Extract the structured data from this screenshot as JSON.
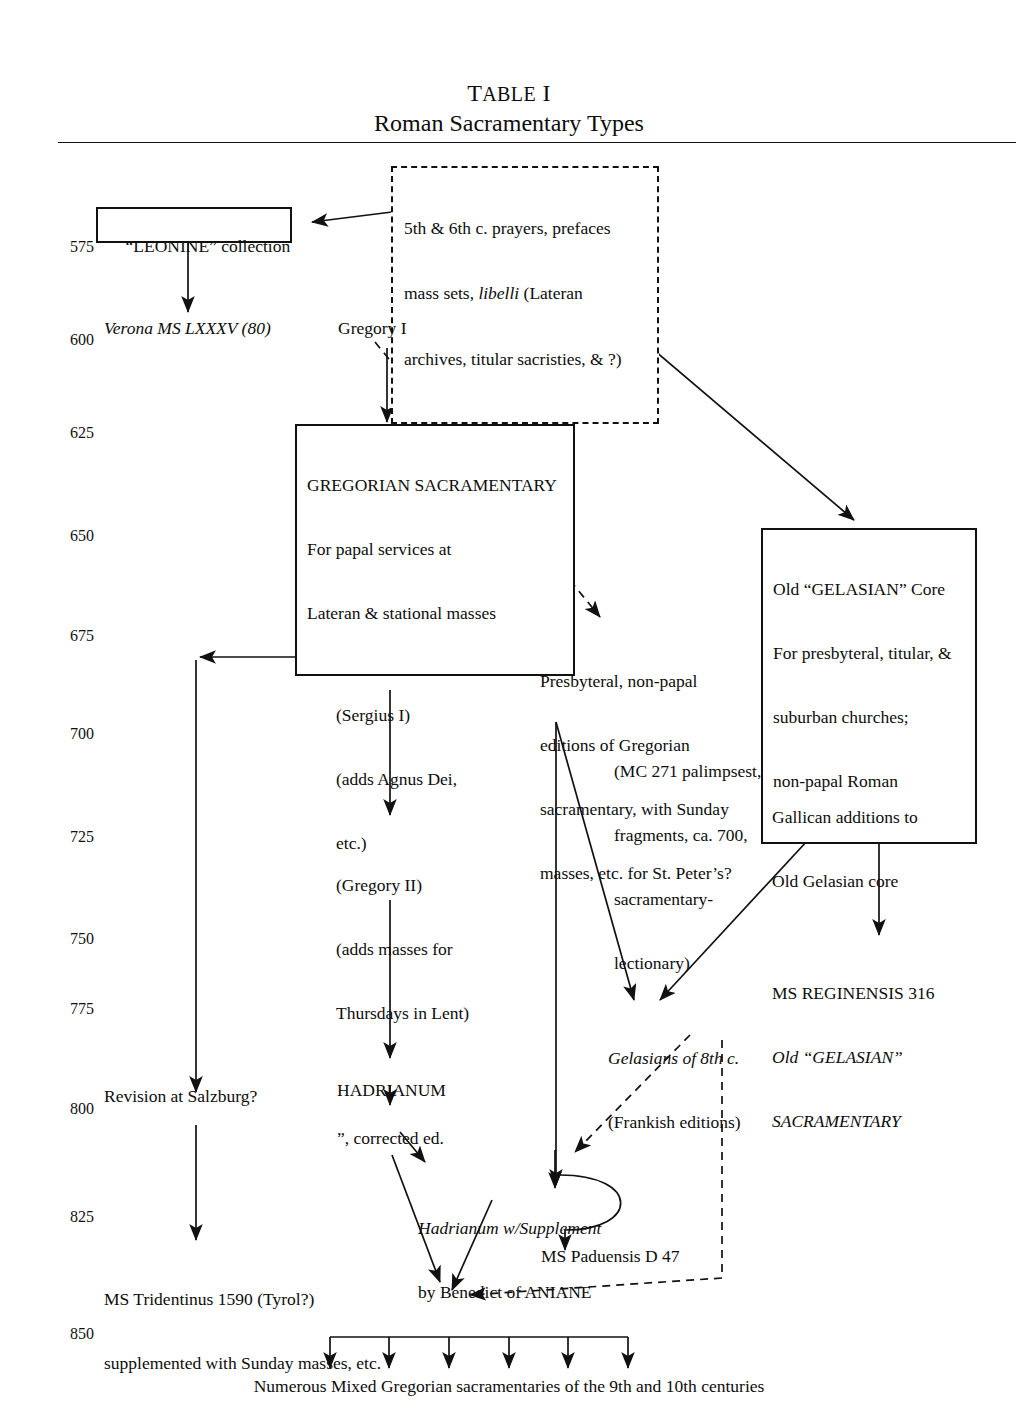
{
  "title": {
    "table_label_small_caps": "TABLE I",
    "table_label_first": "T",
    "table_label_rest": "ABLE",
    "table_label_numeral": "I",
    "subtitle": "Roman Sacramentary Types"
  },
  "timeline": {
    "unit": "AD years",
    "years": [
      "575",
      "600",
      "625",
      "650",
      "675",
      "700",
      "725",
      "750",
      "775",
      "800",
      "825",
      "850"
    ]
  },
  "nodes": {
    "leonine_box": "“LEONINE” collection",
    "libelli_box": {
      "line1": "5th & 6th c. prayers, prefaces",
      "line2_a": "mass sets, ",
      "line2_italic": "libelli",
      "line2_b": " (Lateran",
      "line3": "archives, titular sacristies, & ?)"
    },
    "verona_ms": "Verona MS LXXXV (80)",
    "gregory_i": "Gregory I",
    "gregorian_box": {
      "line1": "GREGORIAN SACRAMENTARY",
      "line2": "For papal services at",
      "line3": "Lateran & stational masses"
    },
    "gelasian_box": {
      "line1": "Old “GELASIAN” Core",
      "line2": "For presbyteral, titular, &",
      "line3": "suburban churches;",
      "line4": "non-papal Roman"
    },
    "presbyteral": {
      "line1": "Presbyteral, non-papal",
      "line2": "editions of Gregorian",
      "line3": "sacramentary, with Sunday",
      "line4": "masses, etc. for St. Peter’s?"
    },
    "mc271": {
      "line1": "(MC 271 palimpsest,",
      "line2": "fragments, ca. 700,",
      "line3": "sacramentary-",
      "line4": "lectionary)"
    },
    "sergius": {
      "line1": "(Sergius I)",
      "line2": "(adds Agnus Dei,",
      "line3": "etc.)"
    },
    "gregory_ii": {
      "line1": "(Gregory II)",
      "line2": "(adds masses for",
      "line3": "Thursdays in Lent)"
    },
    "gallican": {
      "line1": "Gallican additions to",
      "line2": "Old Gelasian core"
    },
    "reginensis": {
      "line1": "MS REGINENSIS 316",
      "line2_italic": "Old “GELASIAN”",
      "line3_italic": "SACRAMENTARY"
    },
    "gelasians_8th": {
      "line1_italic": "Gelasians of 8th c.",
      "line2": "(Frankish editions)"
    },
    "hadrianum": "HADRIANUM",
    "hadrianum_corrected": "”, corrected ed.",
    "salzburg": "Revision at Salzburg?",
    "supplement": {
      "line1_italic": "Hadrianum w/Supplement",
      "line2": "by Benedict of ANIANE"
    },
    "tridentinus": {
      "line1": "MS Tridentinus 1590 (Tyrol?)",
      "line2": "supplemented with Sunday masses, etc."
    },
    "paduensis": "MS Paduensis D 47",
    "bottom_caption": "Numerous Mixed Gregorian sacramentaries of the 9th and 10th centuries"
  },
  "style": {
    "ink": "#111111",
    "paper": "#ffffff"
  }
}
